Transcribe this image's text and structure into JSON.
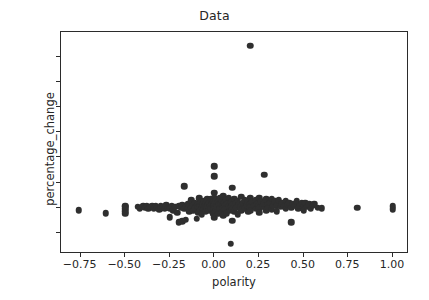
{
  "chart_data": {
    "type": "scatter",
    "title": "Data",
    "xlabel": "polarity",
    "ylabel": "percentage_change",
    "xlim": [
      -0.86,
      1.09
    ],
    "ylim": [
      -37,
      140
    ],
    "xticks": [
      -0.75,
      -0.5,
      -0.25,
      0.0,
      0.25,
      0.5,
      0.75,
      1.0
    ],
    "xtick_labels": [
      "−0.75",
      "−0.50",
      "−0.25",
      "0.00",
      "0.25",
      "0.50",
      "0.75",
      "1.00"
    ],
    "yticks": [
      -20,
      0,
      20,
      40,
      60,
      80,
      100,
      120
    ],
    "ytick_labels": [
      "−20",
      "0",
      "20",
      "40",
      "60",
      "80",
      "100",
      "120"
    ],
    "grid": false,
    "legend": null,
    "marker": {
      "shape": "circle",
      "color": "#2f2f2f",
      "size_px": 6.5
    },
    "points": [
      [
        -0.76,
        -2.0
      ],
      [
        -0.61,
        -4.5
      ],
      [
        -0.5,
        1.5
      ],
      [
        -0.5,
        -1.0
      ],
      [
        -0.5,
        -3.0
      ],
      [
        -0.5,
        -5.0
      ],
      [
        -0.5,
        0.5
      ],
      [
        -0.43,
        0.5
      ],
      [
        -0.42,
        -0.5
      ],
      [
        -0.4,
        1.0
      ],
      [
        -0.39,
        0.0
      ],
      [
        -0.38,
        1.5
      ],
      [
        -0.37,
        -1.0
      ],
      [
        -0.36,
        0.5
      ],
      [
        -0.35,
        1.0
      ],
      [
        -0.34,
        -0.5
      ],
      [
        -0.33,
        1.5
      ],
      [
        -0.32,
        0.0
      ],
      [
        -0.31,
        -1.5
      ],
      [
        -0.3,
        1.0
      ],
      [
        -0.3,
        -0.5
      ],
      [
        -0.29,
        0.5
      ],
      [
        -0.28,
        -1.0
      ],
      [
        -0.27,
        2.0
      ],
      [
        -0.26,
        0.0
      ],
      [
        -0.25,
        -7.5
      ],
      [
        -0.25,
        -0.5
      ],
      [
        -0.24,
        1.0
      ],
      [
        -0.23,
        -2.0
      ],
      [
        -0.22,
        0.5
      ],
      [
        -0.21,
        -4.0
      ],
      [
        -0.2,
        1.5
      ],
      [
        -0.2,
        -11.5
      ],
      [
        -0.19,
        0.0
      ],
      [
        -0.18,
        -11.0
      ],
      [
        -0.18,
        2.0
      ],
      [
        -0.17,
        17.0
      ],
      [
        -0.17,
        -1.0
      ],
      [
        -0.16,
        0.5
      ],
      [
        -0.16,
        -9.5
      ],
      [
        -0.15,
        2.5
      ],
      [
        -0.15,
        -0.5
      ],
      [
        -0.14,
        1.0
      ],
      [
        -0.14,
        -3.0
      ],
      [
        -0.13,
        6.0
      ],
      [
        -0.13,
        0.0
      ],
      [
        -0.12,
        2.0
      ],
      [
        -0.12,
        -2.5
      ],
      [
        -0.11,
        4.0
      ],
      [
        -0.11,
        -0.5
      ],
      [
        -0.1,
        1.5
      ],
      [
        -0.1,
        -9.0
      ],
      [
        -0.095,
        3.0
      ],
      [
        -0.09,
        0.5
      ],
      [
        -0.09,
        -4.0
      ],
      [
        -0.085,
        7.5
      ],
      [
        -0.08,
        1.0
      ],
      [
        -0.08,
        -2.0
      ],
      [
        -0.075,
        4.5
      ],
      [
        -0.07,
        0.0
      ],
      [
        -0.07,
        -5.5
      ],
      [
        -0.065,
        2.5
      ],
      [
        -0.06,
        5.0
      ],
      [
        -0.06,
        -1.0
      ],
      [
        -0.055,
        1.5
      ],
      [
        -0.05,
        3.5
      ],
      [
        -0.05,
        -3.0
      ],
      [
        -0.045,
        0.5
      ],
      [
        -0.04,
        6.5
      ],
      [
        -0.04,
        -0.5
      ],
      [
        -0.035,
        2.0
      ],
      [
        -0.03,
        4.0
      ],
      [
        -0.03,
        -2.0
      ],
      [
        -0.025,
        1.0
      ],
      [
        -0.02,
        7.0
      ],
      [
        -0.02,
        -0.5
      ],
      [
        -0.015,
        3.0
      ],
      [
        -0.01,
        5.5
      ],
      [
        -0.01,
        -4.5
      ],
      [
        -0.005,
        1.5
      ],
      [
        0.0,
        33.0
      ],
      [
        0.0,
        25.0
      ],
      [
        0.0,
        12.0
      ],
      [
        0.0,
        8.0
      ],
      [
        0.0,
        5.0
      ],
      [
        0.0,
        2.0
      ],
      [
        0.0,
        0.0
      ],
      [
        0.0,
        -1.5
      ],
      [
        0.0,
        -4.0
      ],
      [
        0.0,
        -7.5
      ],
      [
        0.005,
        3.5
      ],
      [
        0.01,
        6.0
      ],
      [
        0.01,
        -2.0
      ],
      [
        0.015,
        1.0
      ],
      [
        0.02,
        4.5
      ],
      [
        0.02,
        -5.0
      ],
      [
        0.025,
        2.5
      ],
      [
        0.03,
        7.5
      ],
      [
        0.03,
        -0.5
      ],
      [
        0.035,
        3.0
      ],
      [
        0.04,
        5.5
      ],
      [
        0.04,
        -3.5
      ],
      [
        0.045,
        1.5
      ],
      [
        0.05,
        9.0
      ],
      [
        0.05,
        0.0
      ],
      [
        0.05,
        -6.0
      ],
      [
        0.055,
        4.0
      ],
      [
        0.06,
        2.0
      ],
      [
        0.06,
        -1.0
      ],
      [
        0.065,
        6.5
      ],
      [
        0.07,
        3.0
      ],
      [
        0.07,
        -4.5
      ],
      [
        0.08,
        1.0
      ],
      [
        0.08,
        8.0
      ],
      [
        0.085,
        -2.5
      ],
      [
        0.09,
        4.5
      ],
      [
        0.09,
        -29.0
      ],
      [
        0.095,
        0.5
      ],
      [
        0.1,
        16.0
      ],
      [
        0.1,
        5.0
      ],
      [
        0.1,
        2.0
      ],
      [
        0.1,
        -1.5
      ],
      [
        0.1,
        -10.5
      ],
      [
        0.11,
        7.0
      ],
      [
        0.11,
        -3.0
      ],
      [
        0.12,
        3.5
      ],
      [
        0.12,
        0.0
      ],
      [
        0.13,
        5.5
      ],
      [
        0.13,
        -5.5
      ],
      [
        0.14,
        2.5
      ],
      [
        0.15,
        8.5
      ],
      [
        0.15,
        1.0
      ],
      [
        0.15,
        -2.0
      ],
      [
        0.16,
        4.0
      ],
      [
        0.17,
        6.0
      ],
      [
        0.17,
        -0.5
      ],
      [
        0.18,
        2.0
      ],
      [
        0.19,
        5.0
      ],
      [
        0.19,
        -3.5
      ],
      [
        0.2,
        129.0
      ],
      [
        0.2,
        7.5
      ],
      [
        0.2,
        3.0
      ],
      [
        0.2,
        0.5
      ],
      [
        0.2,
        -2.5
      ],
      [
        0.21,
        4.5
      ],
      [
        0.22,
        1.5
      ],
      [
        0.23,
        6.0
      ],
      [
        0.23,
        -1.0
      ],
      [
        0.24,
        3.0
      ],
      [
        0.25,
        8.0
      ],
      [
        0.25,
        2.0
      ],
      [
        0.25,
        -0.5
      ],
      [
        0.25,
        -4.0
      ],
      [
        0.26,
        5.0
      ],
      [
        0.27,
        1.0
      ],
      [
        0.28,
        26.0
      ],
      [
        0.28,
        3.5
      ],
      [
        0.29,
        6.5
      ],
      [
        0.29,
        -2.0
      ],
      [
        0.3,
        2.5
      ],
      [
        0.3,
        0.0
      ],
      [
        0.31,
        4.0
      ],
      [
        0.32,
        7.0
      ],
      [
        0.32,
        -1.5
      ],
      [
        0.33,
        1.5
      ],
      [
        0.34,
        5.0
      ],
      [
        0.35,
        2.0
      ],
      [
        0.35,
        -3.0
      ],
      [
        0.36,
        6.0
      ],
      [
        0.37,
        0.5
      ],
      [
        0.38,
        3.5
      ],
      [
        0.39,
        1.0
      ],
      [
        0.4,
        5.5
      ],
      [
        0.4,
        -1.0
      ],
      [
        0.41,
        2.5
      ],
      [
        0.42,
        4.0
      ],
      [
        0.43,
        -11.5
      ],
      [
        0.43,
        0.0
      ],
      [
        0.44,
        3.0
      ],
      [
        0.45,
        1.5
      ],
      [
        0.46,
        5.0
      ],
      [
        0.47,
        -0.5
      ],
      [
        0.48,
        2.0
      ],
      [
        0.49,
        3.5
      ],
      [
        0.5,
        1.0
      ],
      [
        0.5,
        -2.0
      ],
      [
        0.51,
        4.0
      ],
      [
        0.52,
        0.5
      ],
      [
        0.53,
        2.5
      ],
      [
        0.54,
        -1.0
      ],
      [
        0.55,
        1.5
      ],
      [
        0.56,
        3.0
      ],
      [
        0.58,
        0.0
      ],
      [
        0.6,
        -0.5
      ],
      [
        0.8,
        0.0
      ],
      [
        1.0,
        1.0
      ],
      [
        1.0,
        -1.5
      ]
    ]
  }
}
